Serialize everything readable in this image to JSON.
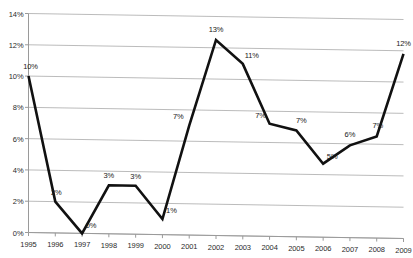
{
  "chart_data": {
    "type": "line",
    "title": "",
    "xlabel": "",
    "ylabel": "",
    "categories": [
      "1995",
      "1996",
      "1997",
      "1998",
      "1999",
      "2000",
      "2001",
      "2002",
      "2003",
      "2004",
      "2005",
      "2006",
      "2007",
      "2008",
      "2009"
    ],
    "values": [
      10.0,
      2.0,
      0.0,
      3.1,
      3.1,
      1.0,
      7.0,
      12.5,
      11.0,
      7.2,
      6.8,
      4.7,
      5.9,
      6.5,
      11.8
    ],
    "data_labels": [
      "10%",
      "2%",
      "0%",
      "3%",
      "3%",
      "1%",
      "7%",
      "13%",
      "11%",
      "7%",
      "7%",
      "5%",
      "6%",
      "7%",
      "12%"
    ],
    "ylim": [
      0,
      14
    ],
    "y_ticks": [
      0,
      2,
      4,
      6,
      8,
      10,
      12,
      14
    ],
    "y_tick_labels": [
      "0%",
      "2%",
      "4%",
      "6%",
      "8%",
      "10%",
      "12%",
      "14%"
    ],
    "grid": true,
    "grid_axis": "y",
    "legend": "none",
    "series_color": "#111111",
    "grid_color": "#b3b3b3",
    "axis_color": "#9a9a9a",
    "line_width": 2.6,
    "markers": false
  }
}
